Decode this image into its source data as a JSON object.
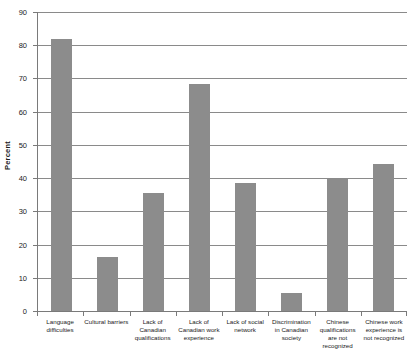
{
  "chart_data": {
    "type": "bar",
    "title": "",
    "subtitle": "",
    "xlabel": "",
    "ylabel": "Percent",
    "ylim": [
      0,
      90
    ],
    "ytick_step": 10,
    "yticks": [
      0,
      10,
      20,
      30,
      40,
      50,
      60,
      70,
      80,
      90
    ],
    "ytick_labels": [
      "0",
      "10",
      "20",
      "30",
      "40",
      "50",
      "60",
      "70",
      "80",
      "90"
    ],
    "grid": "horizontal",
    "legend": "none",
    "bar_color": "#8c8c8c",
    "categories": [
      "Language difficulties",
      "Cultural barriers",
      "Lack of Canadian qualifications",
      "Lack of Canadian work experience",
      "Lack of social network",
      "Discrimination in Canadian society",
      "Chinese qualifications are not recognized",
      "Chinese work experience is not recognized"
    ],
    "values": [
      82.0,
      16.3,
      35.4,
      68.4,
      38.5,
      5.5,
      39.8,
      44.3
    ]
  },
  "axis": {
    "y_title": "Percent"
  }
}
